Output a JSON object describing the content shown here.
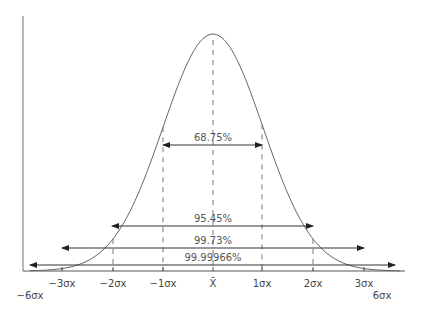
{
  "chart_data": {
    "type": "diagram",
    "title": "",
    "center_label": "X̄",
    "ticks": [
      {
        "label": "−3σx",
        "x": 62
      },
      {
        "label": "−2σx",
        "x": 113
      },
      {
        "label": "−1σx",
        "x": 163
      },
      {
        "label": "X̄",
        "x": 213
      },
      {
        "label": "1σx",
        "x": 262
      },
      {
        "label": "2σx",
        "x": 313
      },
      {
        "label": "3σx",
        "x": 364
      }
    ],
    "outer_labels": {
      "left": "−6σx",
      "right": "6σx"
    },
    "bands": [
      {
        "label": "68.75%",
        "range": "±1σ",
        "x1": 163,
        "x2": 262,
        "y": 145
      },
      {
        "label": "95.45%",
        "range": "±2σ",
        "x1": 112,
        "x2": 313,
        "y": 226
      },
      {
        "label": "99.73%",
        "range": "±3σ",
        "x1": 62,
        "x2": 364,
        "y": 248
      },
      {
        "label": "99.99966%",
        "range": "±6σ",
        "x1": 30,
        "x2": 395,
        "y": 265
      }
    ],
    "colors": {
      "curve": "#666666",
      "axis": "#555555",
      "arrow": "#333333",
      "dash": "#777777"
    }
  }
}
